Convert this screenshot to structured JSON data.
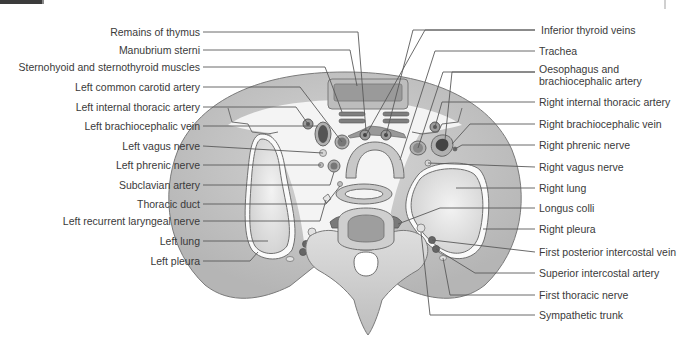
{
  "figure": {
    "colors": {
      "background": "#ffffff",
      "body_wall": "#c9c9c9",
      "body_wall_dark": "#a9a9a9",
      "lung": "#dcdcdc",
      "mediastinum": "#f4f4f4",
      "muscle": "#8d8d8d",
      "vessel_dark": "#555555",
      "bone": "#d2d2d2",
      "outline": "#6f6f6f",
      "leader_line": "#5a5a5a",
      "label_text": "#3a3a3a"
    }
  },
  "labels": {
    "left": [
      {
        "text": "Remains of thymus",
        "y": 32
      },
      {
        "text": "Manubrium sterni",
        "y": 50
      },
      {
        "text": "Sternohyoid and sternothyroid muscles",
        "y": 67
      },
      {
        "text": "Left common carotid artery",
        "y": 87
      },
      {
        "text": "Left internal thoracic artery",
        "y": 107
      },
      {
        "text": "Left brachiocephalic vein",
        "y": 126
      },
      {
        "text": "Left vagus nerve",
        "y": 146
      },
      {
        "text": "Left phrenic nerve",
        "y": 165
      },
      {
        "text": "Subclavian artery",
        "y": 185
      },
      {
        "text": "Thoracic duct",
        "y": 204
      },
      {
        "text": "Left recurrent laryngeal nerve",
        "y": 221
      },
      {
        "text": "Left lung",
        "y": 241
      },
      {
        "text": "Left pleura",
        "y": 261
      }
    ],
    "right": [
      {
        "text": "Inferior thyroid veins",
        "y": 30
      },
      {
        "text": "Trachea",
        "y": 51
      },
      {
        "text": "Oesophagus and",
        "y": 69
      },
      {
        "text": "brachiocephalic artery",
        "y": 81
      },
      {
        "text": "Right internal thoracic artery",
        "y": 102
      },
      {
        "text": "Right brachiocephalic vein",
        "y": 124
      },
      {
        "text": "Right phrenic nerve",
        "y": 145
      },
      {
        "text": "Right vagus nerve",
        "y": 167
      },
      {
        "text": "Right lung",
        "y": 188
      },
      {
        "text": "Longus colli",
        "y": 208
      },
      {
        "text": "Right pleura",
        "y": 229
      },
      {
        "text": "First posterior intercostal vein",
        "y": 252
      },
      {
        "text": "Superior intercostal artery",
        "y": 273
      },
      {
        "text": "First thoracic nerve",
        "y": 295
      },
      {
        "text": "Sympathetic trunk",
        "y": 315
      }
    ]
  }
}
